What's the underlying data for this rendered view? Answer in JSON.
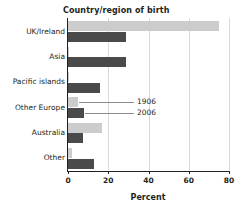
{
  "chart_data": {
    "type": "bar",
    "orientation": "horizontal",
    "title": "Country/region of birth",
    "xlabel": "Percent",
    "ylabel": "",
    "xlim": [
      0,
      80
    ],
    "xticks": [
      0,
      20,
      40,
      60,
      80
    ],
    "grid": true,
    "legend_position": "inline-annotation",
    "categories": [
      "UK/Ireland",
      "Asia",
      "Pacific islands",
      "Other Europe",
      "Australia",
      "Other"
    ],
    "series": [
      {
        "name": "1906",
        "color": "#cccccc",
        "values": [
          75,
          0.4,
          0.3,
          5,
          17,
          2
        ]
      },
      {
        "name": "2006",
        "color": "#4a4a4a",
        "values": [
          29,
          29,
          16,
          8,
          7.5,
          13
        ]
      }
    ],
    "annotations": [
      {
        "label": "1906",
        "points_to": "Other Europe 1906 bar"
      },
      {
        "label": "2006",
        "points_to": "Other Europe 2006 bar"
      }
    ]
  },
  "colors": {
    "series_1906": "#cccccc",
    "series_2006": "#4a4a4a",
    "axis": "#231f20",
    "grid": "#d9d9d9",
    "background": "#ffffff"
  }
}
